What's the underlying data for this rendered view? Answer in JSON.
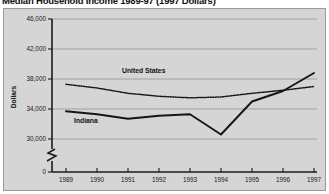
{
  "chart_data": {
    "type": "line",
    "title": "Median Household Income 1989-97 (1997 Dollars)",
    "xlabel": "",
    "ylabel": "Dollars",
    "categories": [
      "1989",
      "1990",
      "1991",
      "1992",
      "1993",
      "1994",
      "1995",
      "1996",
      "1997"
    ],
    "ylim": [
      30000,
      46000
    ],
    "yticks": [
      "0",
      "30,000",
      "34,000",
      "38,000",
      "42,000",
      "46,000"
    ],
    "ytick_values": [
      0,
      30000,
      34000,
      38000,
      42000,
      46000
    ],
    "grid": true,
    "axis_break": true,
    "legend": "inline-labels",
    "series": [
      {
        "name": "United States",
        "style": "dotted",
        "values": [
          37300,
          36800,
          36100,
          35700,
          35500,
          35600,
          36100,
          36500,
          37000
        ]
      },
      {
        "name": "Indiana",
        "style": "solid",
        "values": [
          33700,
          33300,
          32700,
          33100,
          33300,
          30600,
          35000,
          36400,
          38800
        ]
      }
    ]
  },
  "labels": {
    "united_states": "United States",
    "indiana": "Indiana",
    "y_axis_title": "Dollars"
  }
}
